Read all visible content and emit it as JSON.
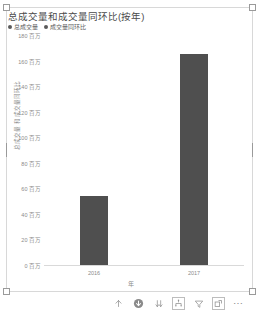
{
  "chart_data": {
    "type": "bar",
    "title": "总成交量和成交量同环比(按年)",
    "categories": [
      "2016",
      "2017"
    ],
    "values": [
      54,
      165
    ],
    "series": [
      {
        "name": "总成交量",
        "values": [
          54,
          165
        ]
      },
      {
        "name": "成交量同环比",
        "values": [
          null,
          null
        ]
      }
    ],
    "xlabel": "年",
    "ylabel": "总成交量 和 成交量同环比",
    "ylim": [
      0,
      180
    ],
    "yticks": [
      {
        "value": 180,
        "label": "180 百万"
      },
      {
        "value": 160,
        "label": "160 百万"
      },
      {
        "value": 140,
        "label": "140 百万"
      },
      {
        "value": 120,
        "label": "120 百万"
      },
      {
        "value": 100,
        "label": "100 百万"
      },
      {
        "value": 80,
        "label": "80 百万"
      },
      {
        "value": 60,
        "label": "60 百万"
      },
      {
        "value": 40,
        "label": "40 百万"
      },
      {
        "value": 20,
        "label": "20 百万"
      },
      {
        "value": 0,
        "label": "0 百万"
      }
    ],
    "legend": [
      {
        "label": "总成交量",
        "color": "#5a5a5a"
      },
      {
        "label": "成交量同环比",
        "color": "#5a5a5a"
      }
    ],
    "legend_position": "top-left",
    "grid": false,
    "bar_color": "#4f4f4f"
  },
  "toolbar": {
    "drill_up_label": "向上钻取",
    "drill_down_label": "向下钻取",
    "expand_label": "展开下一级别",
    "drill_next_label": "转到层次结构中的下一级别",
    "filter_label": "筛选器",
    "focus_label": "聚焦模式",
    "more_label": "更多选项"
  },
  "caption": {
    "text": ""
  }
}
